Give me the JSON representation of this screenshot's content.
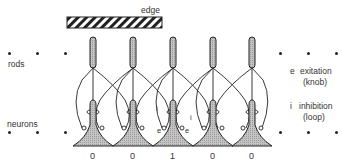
{
  "labels": {
    "edge": "edge",
    "rods": "rods",
    "neurons": "neurons"
  },
  "legend": {
    "excitation_symbol": "e",
    "excitation_label": "exitation",
    "excitation_sub": "(knob)",
    "inhibition_symbol": "i",
    "inhibition_label": "inhibition",
    "inhibition_sub": "(loop)"
  },
  "outputs": [
    "0",
    "0",
    "1",
    "0",
    "0"
  ],
  "annotations": {
    "i_left": "i",
    "i_right": "i",
    "e_left": "e",
    "e_right": "e"
  },
  "colors": {
    "ink": "#222222",
    "fill": "#bdbdbd"
  }
}
